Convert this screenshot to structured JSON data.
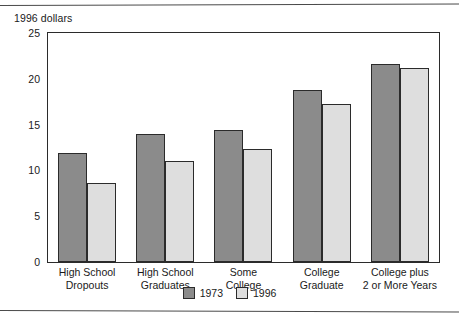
{
  "chart_data": {
    "type": "bar",
    "title": "",
    "ylabel": "1996 dollars",
    "xlabel": "",
    "ylim": [
      0,
      25
    ],
    "yticks": [
      0,
      5,
      10,
      15,
      20,
      25
    ],
    "ytick_labels": [
      "0",
      "5",
      "10",
      "15",
      "20",
      "25"
    ],
    "minor_tick_step": 2.5,
    "grid": false,
    "legend_position": "bottom-center",
    "categories": [
      "High School\nDropouts",
      "High School\nGraduates",
      "Some\nCollege",
      "College\nGraduate",
      "College plus\n2 or More Years"
    ],
    "series": [
      {
        "name": "1973",
        "color": "#8b8b8b",
        "values": [
          11.9,
          14.0,
          14.4,
          18.8,
          21.6
        ]
      },
      {
        "name": "1996",
        "color": "#dedede",
        "values": [
          8.6,
          11.0,
          12.3,
          17.2,
          21.2
        ]
      }
    ]
  },
  "legend": {
    "items": [
      {
        "label": "1973"
      },
      {
        "label": "1996"
      }
    ]
  }
}
